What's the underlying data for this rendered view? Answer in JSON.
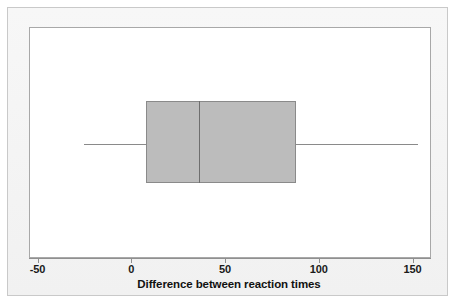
{
  "chart_data": {
    "type": "box",
    "title": "",
    "xlabel": "Difference between reaction times",
    "ylabel": "",
    "orientation": "horizontal",
    "xlim": [
      -65,
      165
    ],
    "xticks": [
      -50,
      0,
      50,
      100,
      150
    ],
    "xticklabels": [
      "-50",
      "0",
      "50",
      "100",
      "150"
    ],
    "grid": false,
    "legend": false,
    "box_fill_color": "#bcbcbc",
    "box_line_color": "#8a8a8a",
    "plot_bg_color": "#ffffff",
    "frame_bg_color": "#f3f3f3",
    "boxes": [
      {
        "name": "Difference between reaction times",
        "whisker_low": -25,
        "q1": 8,
        "median": 36,
        "q3": 88,
        "whisker_high": 153,
        "outliers": []
      }
    ]
  },
  "axis": {
    "title": "Difference between reaction times",
    "ticks": [
      {
        "label": "-50",
        "value": -50
      },
      {
        "label": "0",
        "value": 0
      },
      {
        "label": "50",
        "value": 50
      },
      {
        "label": "100",
        "value": 100
      },
      {
        "label": "150",
        "value": 150
      }
    ]
  }
}
